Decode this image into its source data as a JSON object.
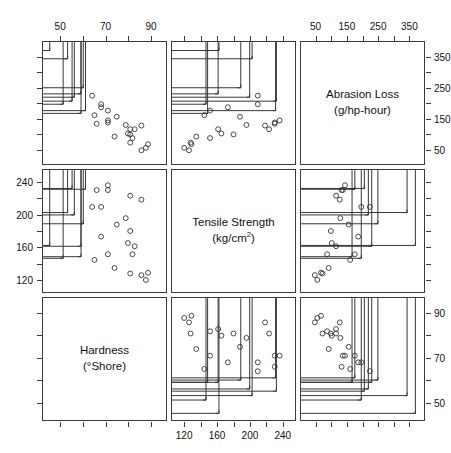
{
  "figure": {
    "type": "scatterplot-matrix",
    "variables": [
      {
        "key": "abrasion",
        "name": "Abrasion Loss",
        "units": "(g/hp-hour)",
        "min": 0,
        "max": 400,
        "ticks": [
          50,
          150,
          250,
          350
        ],
        "minor_ticks": [
          100,
          200,
          300
        ]
      },
      {
        "key": "tensile",
        "name": "Tensile Strength",
        "units": "(kg/cm2)",
        "units_html": "(kg/cm<sup>2</sup>)",
        "min": 104,
        "max": 256,
        "ticks": [
          120,
          160,
          200,
          240
        ],
        "minor_ticks": [
          140,
          180,
          220
        ]
      },
      {
        "key": "hardness",
        "name": "Hardness",
        "units": "(°Shore)",
        "min": 42,
        "max": 97,
        "ticks": [
          50,
          70,
          90
        ],
        "minor_ticks": [
          40,
          60,
          80
        ]
      }
    ],
    "axis_labels": {
      "top_left": [
        "50",
        "70",
        "90"
      ],
      "top_right": [
        "50",
        "150",
        "250",
        "350"
      ],
      "right_row1": [
        "350",
        "250",
        "150",
        "50"
      ],
      "left_row2": [
        "240",
        "200",
        "160",
        "120"
      ],
      "right_row3": [
        "90",
        "70",
        "50"
      ],
      "bottom_middle": [
        "120",
        "160",
        "200",
        "240"
      ]
    },
    "marker_styles": {
      "circle": "open-circle",
      "plus": "plus-sign"
    },
    "stroke_color": "#333333"
  },
  "chart_data": {
    "type": "scatter",
    "title": "",
    "xlabel": "",
    "ylabel": "",
    "variables": [
      "hardness",
      "tensile",
      "abrasion"
    ],
    "axis_ranges": {
      "hardness": [
        42,
        97
      ],
      "tensile": [
        104,
        256
      ],
      "abrasion": [
        0,
        400
      ]
    },
    "grid": false,
    "legend": "none",
    "marker_key": "circle = low group, plus = high group",
    "points": [
      {
        "hardness": 45,
        "tensile": 162,
        "abrasion": 372,
        "marker": "plus"
      },
      {
        "hardness": 55,
        "tensile": 233,
        "abrasion": 206,
        "marker": "plus"
      },
      {
        "hardness": 61,
        "tensile": 232,
        "abrasion": 175,
        "marker": "plus"
      },
      {
        "hardness": 66,
        "tensile": 231,
        "abrasion": 132,
        "marker": "circle"
      },
      {
        "hardness": 71,
        "tensile": 231,
        "abrasion": 136,
        "marker": "circle"
      },
      {
        "hardness": 71,
        "tensile": 237,
        "abrasion": 143,
        "marker": "circle"
      },
      {
        "hardness": 81,
        "tensile": 224,
        "abrasion": 114,
        "marker": "circle"
      },
      {
        "hardness": 86,
        "tensile": 219,
        "abrasion": 126,
        "marker": "circle"
      },
      {
        "hardness": 53,
        "tensile": 203,
        "abrasion": 345,
        "marker": "plus"
      },
      {
        "hardness": 60,
        "tensile": 189,
        "abrasion": 250,
        "marker": "plus"
      },
      {
        "hardness": 64,
        "tensile": 210,
        "abrasion": 224,
        "marker": "circle"
      },
      {
        "hardness": 68,
        "tensile": 210,
        "abrasion": 196,
        "marker": "circle"
      },
      {
        "hardness": 79,
        "tensile": 196,
        "abrasion": 128,
        "marker": "circle"
      },
      {
        "hardness": 81,
        "tensile": 180,
        "abrasion": 97,
        "marker": "circle"
      },
      {
        "hardness": 56,
        "tensile": 200,
        "abrasion": 219,
        "marker": "plus"
      },
      {
        "hardness": 68,
        "tensile": 173,
        "abrasion": 186,
        "marker": "circle"
      },
      {
        "hardness": 75,
        "tensile": 188,
        "abrasion": 155,
        "marker": "circle"
      },
      {
        "hardness": 83,
        "tensile": 161,
        "abrasion": 114,
        "marker": "circle"
      },
      {
        "hardness": 88,
        "tensile": 119,
        "abrasion": 53,
        "marker": "circle"
      },
      {
        "hardness": 59,
        "tensile": 161,
        "abrasion": 230,
        "marker": "plus"
      },
      {
        "hardness": 71,
        "tensile": 151,
        "abrasion": 175,
        "marker": "circle"
      },
      {
        "hardness": 80,
        "tensile": 165,
        "abrasion": 100,
        "marker": "circle"
      },
      {
        "hardness": 82,
        "tensile": 151,
        "abrasion": 85,
        "marker": "circle"
      },
      {
        "hardness": 89,
        "tensile": 128,
        "abrasion": 65,
        "marker": "circle"
      },
      {
        "hardness": 51,
        "tensile": 146,
        "abrasion": 196,
        "marker": "plus"
      },
      {
        "hardness": 59,
        "tensile": 148,
        "abrasion": 166,
        "marker": "plus"
      },
      {
        "hardness": 65,
        "tensile": 144,
        "abrasion": 160,
        "marker": "circle"
      },
      {
        "hardness": 74,
        "tensile": 134,
        "abrasion": 90,
        "marker": "circle"
      },
      {
        "hardness": 81,
        "tensile": 127,
        "abrasion": 70,
        "marker": "circle"
      },
      {
        "hardness": 86,
        "tensile": 125,
        "abrasion": 45,
        "marker": "circle"
      }
    ]
  },
  "panels": {
    "r1c1": {
      "x": "hardness",
      "y": "abrasion",
      "kind": "scatter"
    },
    "r1c2": {
      "x": "tensile",
      "y": "abrasion",
      "kind": "scatter"
    },
    "r1c3": {
      "kind": "label",
      "line1": "Abrasion Loss",
      "line2": "(g/hp-hour)"
    },
    "r2c1": {
      "x": "hardness",
      "y": "tensile",
      "kind": "scatter"
    },
    "r2c2": {
      "kind": "label",
      "line1": "Tensile Strength",
      "line2": "(kg/cm",
      "sup": "2",
      "line2b": ")"
    },
    "r2c3": {
      "x": "abrasion",
      "y": "tensile",
      "kind": "scatter"
    },
    "r3c1": {
      "kind": "label",
      "line1": "Hardness",
      "line2": "(°Shore)"
    },
    "r3c2": {
      "x": "tensile",
      "y": "hardness",
      "kind": "scatter"
    },
    "r3c3": {
      "x": "abrasion",
      "y": "hardness",
      "kind": "scatter"
    }
  }
}
